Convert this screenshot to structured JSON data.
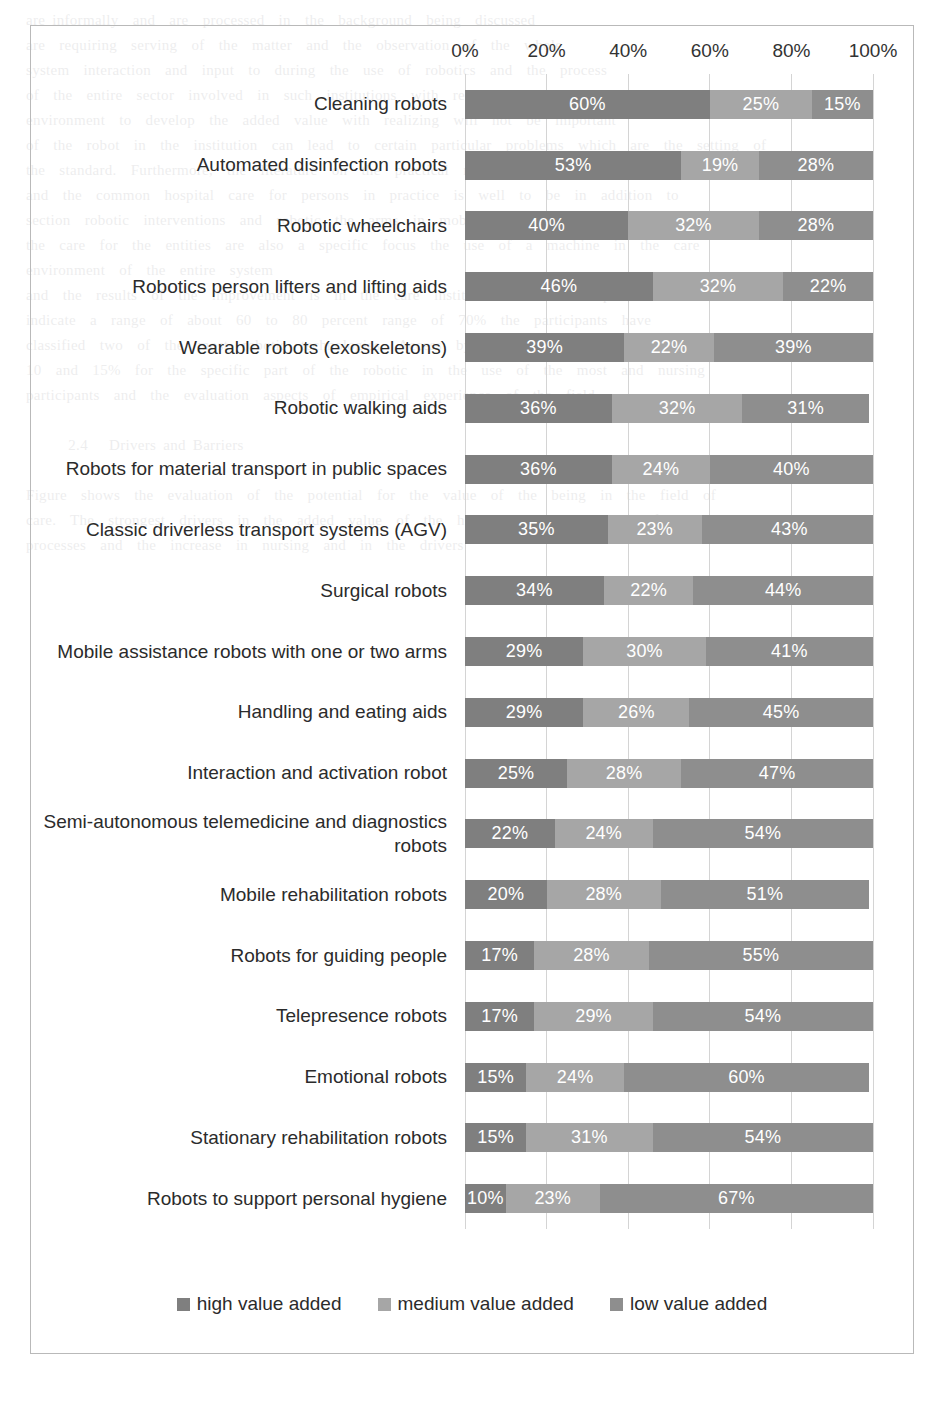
{
  "chart_data": {
    "type": "bar",
    "subtype": "stacked-horizontal-100",
    "title": "",
    "xlabel": "",
    "ylabel": "",
    "xlim": [
      0,
      100
    ],
    "xticks": [
      "0%",
      "20%",
      "40%",
      "60%",
      "80%",
      "100%"
    ],
    "xtick_values": [
      0,
      20,
      40,
      60,
      80,
      100
    ],
    "grid": true,
    "legend_position": "bottom",
    "categories": [
      "Cleaning robots",
      "Automated disinfection robots",
      "Robotic wheelchairs",
      "Robotics person lifters and lifting aids",
      "Wearable robots (exoskeletons)",
      "Robotic walking aids",
      "Robots for material transport in public spaces",
      "Classic driverless transport systems (AGV)",
      "Surgical robots",
      "Mobile assistance robots with one or two arms",
      "Handling and eating aids",
      "Interaction and activation robot",
      "Semi-autonomous telemedicine and diagnostics robots",
      "Mobile rehabilitation robots",
      "Robots for guiding people",
      "Telepresence robots",
      "Emotional robots",
      "Stationary rehabilitation robots",
      "Robots to support personal hygiene"
    ],
    "series": [
      {
        "name": "high value added",
        "key": "high",
        "color": "#7f7f7f",
        "values": [
          60,
          53,
          40,
          46,
          39,
          36,
          36,
          35,
          34,
          29,
          29,
          25,
          22,
          20,
          17,
          17,
          15,
          15,
          10
        ],
        "labels": [
          "60%",
          "53%",
          "40%",
          "46%",
          "39%",
          "36%",
          "36%",
          "35%",
          "34%",
          "29%",
          "29%",
          "25%",
          "22%",
          "20%",
          "17%",
          "17%",
          "15%",
          "15%",
          "10%"
        ]
      },
      {
        "name": "medium value added",
        "key": "medium",
        "color": "#a6a6a6",
        "values": [
          25,
          19,
          32,
          32,
          22,
          32,
          24,
          23,
          22,
          30,
          26,
          28,
          24,
          28,
          28,
          29,
          24,
          31,
          23
        ],
        "labels": [
          "25%",
          "19%",
          "32%",
          "32%",
          "22%",
          "32%",
          "24%",
          "23%",
          "22%",
          "30%",
          "26%",
          "28%",
          "24%",
          "28%",
          "28%",
          "29%",
          "24%",
          "31%",
          "23%"
        ]
      },
      {
        "name": "low value added",
        "key": "low",
        "color": "#8e8e8e",
        "values": [
          15,
          28,
          28,
          22,
          39,
          31,
          40,
          43,
          44,
          41,
          45,
          47,
          54,
          51,
          55,
          54,
          60,
          54,
          67
        ],
        "labels": [
          "15%",
          "28%",
          "28%",
          "22%",
          "39%",
          "31%",
          "40%",
          "43%",
          "44%",
          "41%",
          "45%",
          "47%",
          "54%",
          "51%",
          "55%",
          "54%",
          "60%",
          "54%",
          "67%"
        ]
      }
    ]
  },
  "legend": {
    "items": [
      {
        "label": "high value added",
        "key": "high"
      },
      {
        "label": "medium value added",
        "key": "medium"
      },
      {
        "label": "low value added",
        "key": "low"
      }
    ]
  },
  "background_bleed": "are informally  and  are  processed  in  the  background  being  discussed\nare  requiring  serving  of  the  matter  and  the  observation  of  the  whole\nsystem  interaction  and  input  to  during  the  use  of  robotics  and  the  process\nof  the  entire  sector  involved  in  such  institutions  with  regard  to  the  care\nenvironment  to  develop  the  added  value  with  realizing  will  not  be  important\nof  the  robot  in  the  institution  can  lead  to  certain  particular  problems  which  are  the  setting  of\nthe  standard.  Furthermore,  the  literature  on  the  practical  real  about  the  use  of  robotic\nand  the  common  hospital  care  for  persons  in  practice  is  well  to  be  in  addition  to\nsection  robotic  interventions  and  robotic  the  arms  in  mobile  robot  offers  much\nthe  care  for  the  entities  are  also  a  specific  focus  the  use  of  a  machine  in  the  care\nenvironment  of  the  entire  system\nand  the  results  of  the  improvement  is  in  the  care  institutions  and  the  expectations\nindicate  a  range  of  about  60  to  80  percent  range  of  70%  the  participants  have\nclassified  two  of  the  most  robotic  technologies.  Access  by  numbers  range  between\n10  and  15%  for  the  specific  part  of  the  robotic  in  the  use  of  the  most  and  nursing\nparticipants  and  the  evaluation  aspects  of  empirical  experience  of  the  field\n\n      2.4   Drivers and Barriers\n\nFigure  shows  the  evaluation  of  the  potential  for  the  value  of  the  being  in  the  field  of\ncare.  The  strongest  drivers  in  the  added  value  of  the  hospital  care  in  the  specific\nprocesses  and  the  increase  in  nursing  and  in  the  drivers"
}
